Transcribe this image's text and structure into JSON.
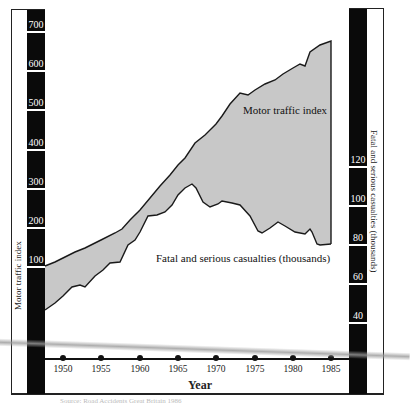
{
  "chart_data": {
    "type": "area",
    "title": "",
    "xlabel": "Year",
    "x_ticks": [
      "1950",
      "1955",
      "1960",
      "1965",
      "1970",
      "1975",
      "1980",
      "1985"
    ],
    "x": [
      1948,
      1950,
      1955,
      1960,
      1965,
      1966,
      1970,
      1975,
      1980,
      1985
    ],
    "left_axis": {
      "label": "Motor traffic index",
      "ticks": [
        "100",
        "200",
        "300",
        "400",
        "500",
        "600",
        "700"
      ],
      "ylim": [
        0,
        700
      ]
    },
    "right_axis": {
      "label": "Fatal and serious casualties (thousands)",
      "ticks": [
        "40",
        "60",
        "80",
        "100",
        "120"
      ],
      "ylim": [
        0,
        130
      ]
    },
    "series": [
      {
        "name": "Motor traffic index",
        "axis": "left",
        "values": [
          95,
          115,
          160,
          213,
          340,
          370,
          450,
          545,
          605,
          670
        ]
      },
      {
        "name": "Fatal and serious casualties (thousands)",
        "axis": "right",
        "values": [
          45,
          50,
          59,
          78,
          96,
          110,
          99,
          90,
          88,
          79
        ]
      }
    ],
    "fill_between": true,
    "grid": false,
    "legend": "inline labels"
  },
  "labels": {
    "motor_series": "Motor traffic index",
    "casualty_series": "Fatal and serious casualties (thousands)",
    "left_axis_title": "Motor traffic index",
    "right_axis_title": "Fatal and serious casualties (thousands)",
    "x_axis_title": "Year",
    "caption": "Source: Road Accidents Great Britain 1986"
  },
  "left_ticks": [
    {
      "label": "700",
      "y": 29
    },
    {
      "label": "600",
      "y": 68
    },
    {
      "label": "500",
      "y": 107
    },
    {
      "label": "400",
      "y": 147
    },
    {
      "label": "300",
      "y": 186
    },
    {
      "label": "200",
      "y": 225
    },
    {
      "label": "100",
      "y": 264
    }
  ],
  "right_ticks": [
    {
      "label": "120",
      "y": 164
    },
    {
      "label": "100",
      "y": 203
    },
    {
      "label": "80",
      "y": 242
    },
    {
      "label": "60",
      "y": 281
    },
    {
      "label": "40",
      "y": 320
    }
  ],
  "x_ticks": [
    {
      "label": "1950",
      "x": 63
    },
    {
      "label": "1955",
      "x": 101
    },
    {
      "label": "1960",
      "x": 140
    },
    {
      "label": "1965",
      "x": 178
    },
    {
      "label": "1970",
      "x": 216
    },
    {
      "label": "1975",
      "x": 255
    },
    {
      "label": "1980",
      "x": 293
    },
    {
      "label": "1985",
      "x": 331
    }
  ],
  "colors": {
    "fill": "#c8c8c8",
    "line": "#1a1a1a",
    "axis_bar": "#0a0a0a"
  }
}
